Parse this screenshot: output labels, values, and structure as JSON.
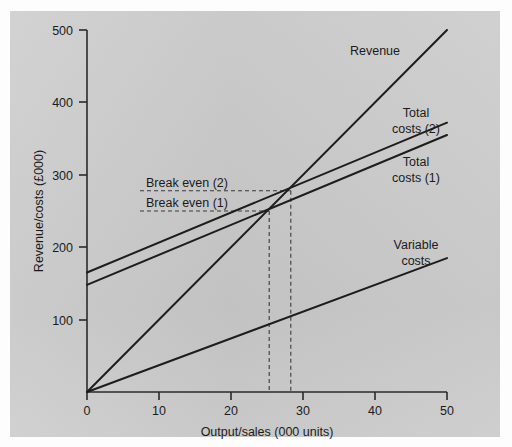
{
  "chart_data": {
    "type": "line",
    "title": "",
    "xlabel": "Output/sales (000 units)",
    "ylabel": "Revenue/costs (£000)",
    "xlim": [
      0,
      50
    ],
    "ylim": [
      0,
      500
    ],
    "xticks": [
      0,
      10,
      20,
      30,
      40,
      50
    ],
    "xtick_labels": [
      "0",
      "10",
      "20",
      "30",
      "40",
      "50"
    ],
    "yticks": [
      0,
      100,
      200,
      300,
      400,
      500
    ],
    "ytick_labels": [
      "0",
      "100",
      "200",
      "300",
      "400",
      "500"
    ],
    "grid": false,
    "legend_position": "inline-right",
    "series": [
      {
        "name": "Revenue",
        "label": "Revenue",
        "x": [
          0,
          50
        ],
        "values": [
          0,
          500
        ]
      },
      {
        "name": "Total costs (2)",
        "label": "Total costs (2)",
        "x": [
          0,
          50
        ],
        "values": [
          165,
          372
        ]
      },
      {
        "name": "Total costs (1)",
        "label": "Total costs (1)",
        "x": [
          0,
          50
        ],
        "values": [
          148,
          355
        ]
      },
      {
        "name": "Variable costs",
        "label": "Variable costs",
        "x": [
          0,
          50
        ],
        "values": [
          0,
          185
        ]
      }
    ],
    "annotations": [
      {
        "label": "Break even (2)",
        "y_value": 278,
        "x_value": 28.3,
        "style": "dashed-guide"
      },
      {
        "label": "Break even (1)",
        "y_value": 250,
        "x_value": 25.3,
        "style": "dashed-guide"
      }
    ],
    "colors": {
      "panel_background": "#c9c9c9",
      "line": "#1d1d1d",
      "axis": "#2a2a2a",
      "guide": "#3a3a3a",
      "text": "#1b1b1b"
    }
  },
  "labels": {
    "revenue": "Revenue",
    "total_costs_2_line1": "Total",
    "total_costs_2_line2": "costs (2)",
    "total_costs_1_line1": "Total",
    "total_costs_1_line2": "costs (1)",
    "variable_costs_line1": "Variable",
    "variable_costs_line2": "costs",
    "break_even_2": "Break even (2)",
    "break_even_1": "Break even (1)",
    "x_axis_title": "Output/sales (000 units)",
    "y_axis_title": "Revenue/costs (£000)"
  },
  "ticks": {
    "y": [
      "500",
      "400",
      "300",
      "200",
      "100",
      "0"
    ],
    "x": [
      "0",
      "10",
      "20",
      "30",
      "40",
      "50"
    ]
  }
}
